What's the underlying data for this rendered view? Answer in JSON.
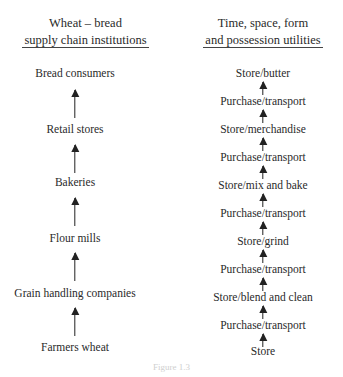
{
  "left": {
    "title_line1": "Wheat – bread",
    "title_line2": "supply chain institutions",
    "items": [
      "Bread consumers",
      "Retail stores",
      "Bakeries",
      "Flour mills",
      "Grain handling companies",
      "Farmers wheat"
    ]
  },
  "right": {
    "title_line1": "Time, space, form",
    "title_line2": "and possession utilities",
    "items": [
      "Store/butter",
      "Purchase/transport",
      "Store/merchandise",
      "Purchase/transport",
      "Store/mix and bake",
      "Purchase/transport",
      "Store/grind",
      "Purchase/transport",
      "Store/blend and clean",
      "Purchase/transport",
      "Store"
    ]
  },
  "caption": "Figure 1.3"
}
